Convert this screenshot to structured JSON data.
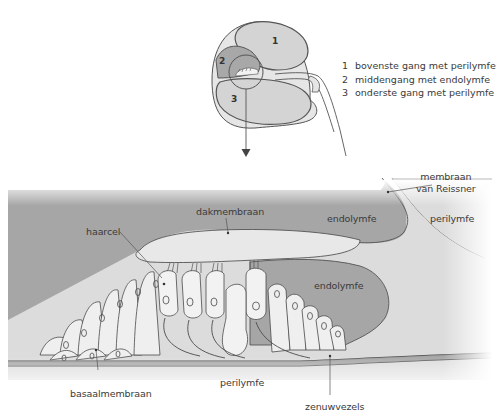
{
  "overview": {
    "compartments": [
      {
        "number": "1",
        "label": "bovenste gang met perilymfe"
      },
      {
        "number": "2",
        "label": "middengang met endolymfe"
      },
      {
        "number": "3",
        "label": "onderste gang met perilymfe"
      }
    ]
  },
  "detail": {
    "labels": {
      "membraan_reissner_line1": "membraan",
      "membraan_reissner_line2": "van Reissner",
      "dakmembraan": "dakmembraan",
      "haarcel": "haarcel",
      "endolymfe_upper": "endolymfe",
      "endolymfe_lower": "endolymfe",
      "perilymfe_upper": "perilymfe",
      "perilymfe_lower": "perilymfe",
      "basaalmembraan": "basaalmembraan",
      "zenuwvezels": "zenuwvezels"
    }
  },
  "colors": {
    "background": "#ffffff",
    "dark_fluid": "#a6a6a6",
    "light_fluid": "#dcdcdc",
    "cell_fill": "#efefef",
    "outline": "#4a4a4a",
    "text": "#3a3a3a"
  }
}
